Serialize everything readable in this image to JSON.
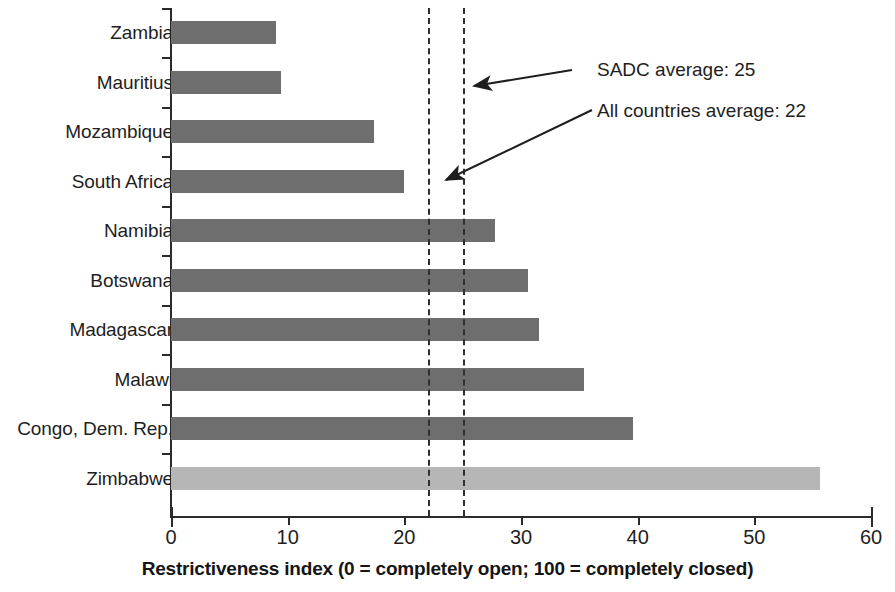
{
  "chart_data": {
    "type": "bar",
    "orientation": "horizontal",
    "title": "",
    "xlabel": "Restrictiveness index (0 = completely open; 100 = completely closed)",
    "ylabel": "",
    "xlim": [
      0,
      60
    ],
    "xticks": [
      0,
      10,
      20,
      30,
      40,
      50,
      60
    ],
    "grid": false,
    "legend": "none",
    "categories": [
      "Zambia",
      "Mauritius",
      "Mozambique",
      "South Africa",
      "Namibia",
      "Botswana",
      "Madagascar",
      "Malawi",
      "Congo, Dem. Rep.",
      "Zimbabwe"
    ],
    "values": [
      9.0,
      9.4,
      17.4,
      20.0,
      27.8,
      30.6,
      31.5,
      35.4,
      39.6,
      55.6
    ],
    "bar_colors": [
      "#6e6e6e",
      "#6e6e6e",
      "#6e6e6e",
      "#6e6e6e",
      "#6e6e6e",
      "#6e6e6e",
      "#6e6e6e",
      "#6e6e6e",
      "#6e6e6e",
      "#b6b6b6"
    ],
    "highlight_category": "Zimbabwe",
    "reference_lines": [
      {
        "name": "all-countries-average",
        "value": 22,
        "label": "All countries average: 22",
        "style": "dashed"
      },
      {
        "name": "sadc-average",
        "value": 25,
        "label": "SADC average: 25",
        "style": "dashed"
      }
    ],
    "annotations": [
      {
        "name": "sadc-average",
        "text": "SADC average: 25",
        "points_to": 25
      },
      {
        "name": "all-countries-average",
        "text": "All countries average: 22",
        "points_to": 22
      }
    ]
  },
  "axis": {
    "x_tick_labels": [
      "0",
      "10",
      "20",
      "30",
      "40",
      "50",
      "60"
    ],
    "x_title": "Restrictiveness index (0 = completely open; 100 = completely closed)"
  },
  "colors": {
    "bar_default": "#6e6e6e",
    "bar_highlight": "#b6b6b6",
    "axis": "#2b2b2b",
    "text": "#1e1e1e",
    "reference_line": "#2f2f2f",
    "background": "#ffffff"
  }
}
